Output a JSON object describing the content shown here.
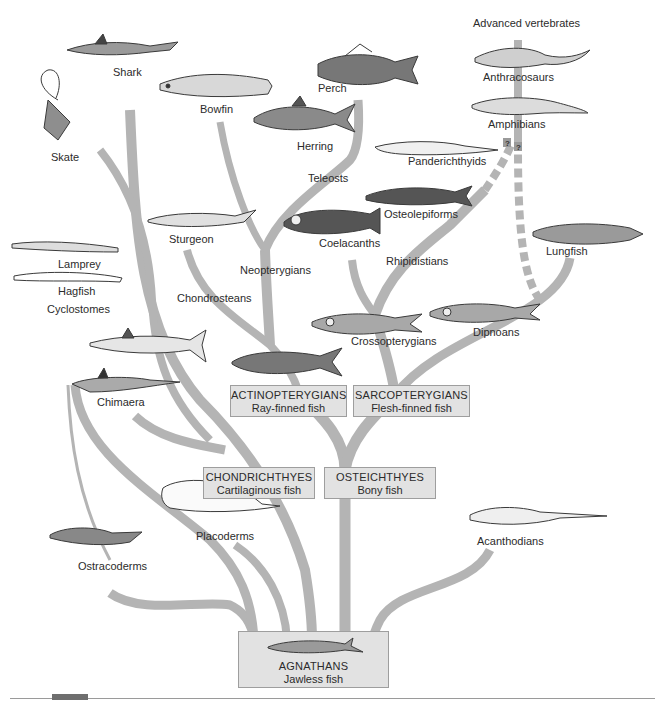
{
  "diagram": {
    "colors": {
      "branch": "#b4b4b4",
      "box_fill": "#e2e2e2",
      "box_border": "#9e9e9e",
      "text": "#2b2b2b",
      "fish_ink": "#3a3a3a"
    },
    "group_boxes": {
      "agnathans": {
        "name": "AGNATHANS",
        "common": "Jawless fish"
      },
      "chondrichthyes": {
        "name": "CHONDRICHTHYES",
        "common": "Cartilaginous fish"
      },
      "osteichthyes": {
        "name": "OSTEICHTHYES",
        "common": "Bony fish"
      },
      "actinopterygians": {
        "name": "ACTINOPTERYGIANS",
        "common": "Ray-finned fish"
      },
      "sarcopterygians": {
        "name": "SARCOPTERYGIANS",
        "common": "Flesh-finned fish"
      }
    },
    "taxa_labels": {
      "advanced_vertebrates": "Advanced vertebrates",
      "anthracosaurs": "Anthracosaurs",
      "amphibians": "Amphibians",
      "panderichthyids": "Panderichthyids",
      "osteolepiforms": "Osteolepiforms",
      "rhipidistians": "Rhipidistians",
      "lungfish": "Lungfish",
      "dipnoans": "Dipnoans",
      "crossopterygians": "Crossopterygians",
      "coelacanths": "Coelacanths",
      "teleosts": "Teleosts",
      "perch": "Perch",
      "herring": "Herring",
      "bowfin": "Bowfin",
      "neopterygians": "Neopterygians",
      "sturgeon": "Sturgeon",
      "chondrosteans": "Chondrosteans",
      "shark": "Shark",
      "skate": "Skate",
      "lamprey": "Lamprey",
      "hagfish": "Hagfish",
      "cyclostomes": "Cyclostomes",
      "chimaera": "Chimaera",
      "placoderms": "Placoderms",
      "ostracoderms": "Ostracoderms",
      "acanthodians": "Acanthodians"
    },
    "uncertainty_marks": [
      "?",
      "?"
    ]
  }
}
